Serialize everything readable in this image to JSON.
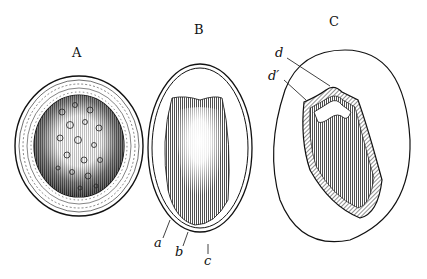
{
  "figure": {
    "panels": [
      {
        "id": "A",
        "label": "A",
        "description": "cross-section with thick layered wall and speckled interior"
      },
      {
        "id": "B",
        "label": "B",
        "description": "outline with shaded inner body and two outer membranes",
        "callouts": [
          {
            "label": "a"
          },
          {
            "label": "b"
          },
          {
            "label": "c"
          }
        ]
      },
      {
        "id": "C",
        "label": "C",
        "description": "large oval containing a cap-shaped hatched structure",
        "callouts": [
          {
            "label": "d"
          },
          {
            "label": "d′"
          }
        ]
      }
    ],
    "colors": {
      "ink": "#111111",
      "paper": "#ffffff"
    }
  }
}
